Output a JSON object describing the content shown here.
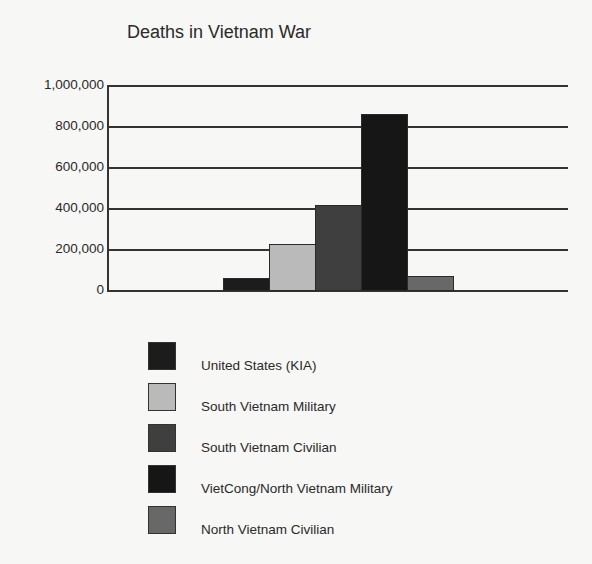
{
  "title": "Deaths in Vietnam War",
  "y_ticks": [
    "1,000,000",
    "800,000",
    "600,000",
    "400,000",
    "200,000",
    "0"
  ],
  "legend": [
    {
      "label": "United States (KIA)",
      "color": "#1c1c1c"
    },
    {
      "label": "South Vietnam Military",
      "color": "#bababa"
    },
    {
      "label": "South Vietnam Civilian",
      "color": "#3f3f3f"
    },
    {
      "label": "VietCong/North Vietnam Military",
      "color": "#161616"
    },
    {
      "label": "North Vietnam Civilian",
      "color": "#686868"
    }
  ],
  "chart_data": {
    "type": "bar",
    "title": "Deaths in Vietnam War",
    "xlabel": "",
    "ylabel": "",
    "categories": [
      "United States (KIA)",
      "South Vietnam Military",
      "South Vietnam Civilian",
      "VietCong/North Vietnam Military",
      "North Vietnam Civilian"
    ],
    "values": [
      58000,
      224000,
      415000,
      860000,
      70000
    ],
    "colors": [
      "#1c1c1c",
      "#bababa",
      "#3f3f3f",
      "#161616",
      "#686868"
    ],
    "ylim": [
      0,
      1000000
    ],
    "yticks": [
      0,
      200000,
      400000,
      600000,
      800000,
      1000000
    ],
    "grid": true,
    "legend_position": "bottom"
  }
}
